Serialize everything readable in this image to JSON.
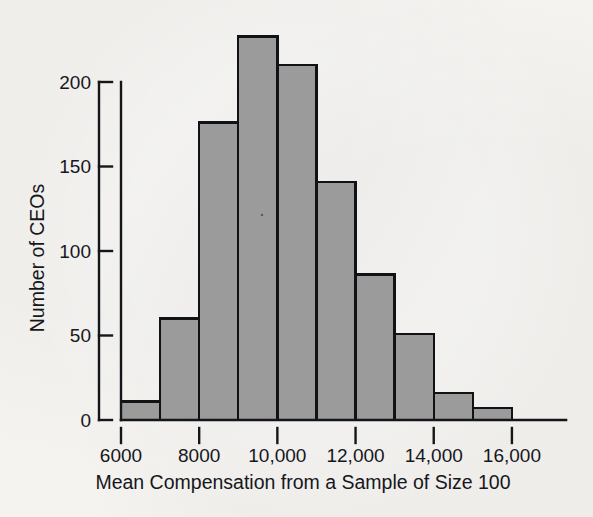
{
  "figure": {
    "background_color": "#f4f3f0",
    "ink_color": "#16171b",
    "bar_fill_color": "#9b9b9b",
    "bar_border_color": "#111216"
  },
  "chart_data": {
    "type": "bar",
    "title": "",
    "subtitle": "",
    "xlabel": "Mean Compensation from a Sample of Size 100",
    "ylabel": "Number of CEOs",
    "grid": false,
    "legend": false,
    "legend_position": "none",
    "xlim": [
      6000,
      17000
    ],
    "ylim": [
      0,
      235
    ],
    "bin_width": 1000,
    "xticks": [
      6000,
      8000,
      10000,
      12000,
      14000,
      16000
    ],
    "xtick_labels": [
      "6000",
      "8000",
      "10,000",
      "12,000",
      "14,000",
      "16,000"
    ],
    "yticks": [
      0,
      50,
      100,
      150,
      200
    ],
    "ytick_labels": [
      "0",
      "50",
      "100",
      "150",
      "200"
    ],
    "bin_edges": [
      6000,
      7000,
      8000,
      9000,
      10000,
      11000,
      12000,
      13000,
      14000,
      15000,
      16000,
      17000
    ],
    "categories": [
      "6000-7000",
      "7000-8000",
      "8000-9000",
      "9000-10,000",
      "10,000-11,000",
      "11,000-12,000",
      "12,000-13,000",
      "13,000-14,000",
      "14,000-15,000",
      "15,000-16,000",
      "16,000-17,000"
    ],
    "values": [
      11,
      60,
      176,
      227,
      210,
      141,
      86,
      51,
      16,
      7,
      0
    ]
  }
}
